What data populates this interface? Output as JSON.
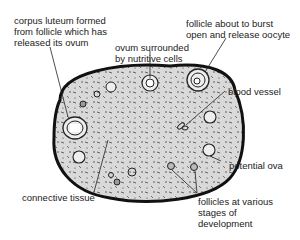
{
  "diagram": {
    "labels": {
      "corpus_luteum": "corpus luteum formed\nfrom follicle which has\nreleased its ovum",
      "ovum_surrounded": "ovum surrounded\nby nutritive cells",
      "follicle_burst": "follicle about to burst\nopen and release oocyte",
      "blood_vessel": "blood vessel",
      "potential_ova": "potential ova",
      "connective_tissue": "connective tissue",
      "follicles_various": "follicles at various\nstages of\ndevelopment"
    },
    "colors": {
      "outline": "#111111",
      "fill": "#d9d9d9",
      "text": "#222222"
    }
  }
}
